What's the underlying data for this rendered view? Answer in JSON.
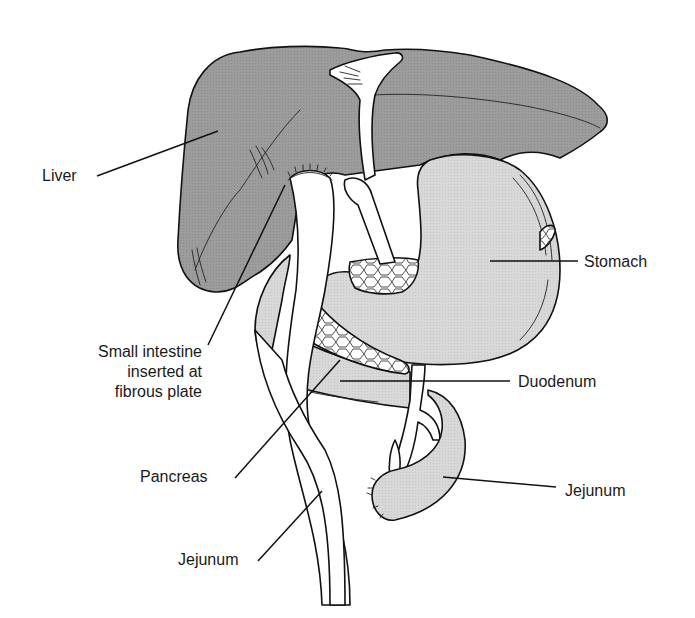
{
  "figure": {
    "colors": {
      "liver": "#9a9a9a",
      "stomach": "#d6d6d6",
      "duodenum": "#cfcfcf",
      "jejunum_loop": "#cdcdcd",
      "intestine_limb": "#ffffff",
      "pancreas": "#ffffff",
      "outline": "#111111",
      "background": "#ffffff"
    }
  },
  "labels": {
    "liver": "Liver",
    "stomach": "Stomach",
    "small_intestine_line1": "Small intestine",
    "small_intestine_line2": "inserted at",
    "small_intestine_line3": "fibrous plate",
    "duodenum": "Duodenum",
    "pancreas": "Pancreas",
    "jejunum_right": "Jejunum",
    "jejunum_left": "Jejunum"
  }
}
